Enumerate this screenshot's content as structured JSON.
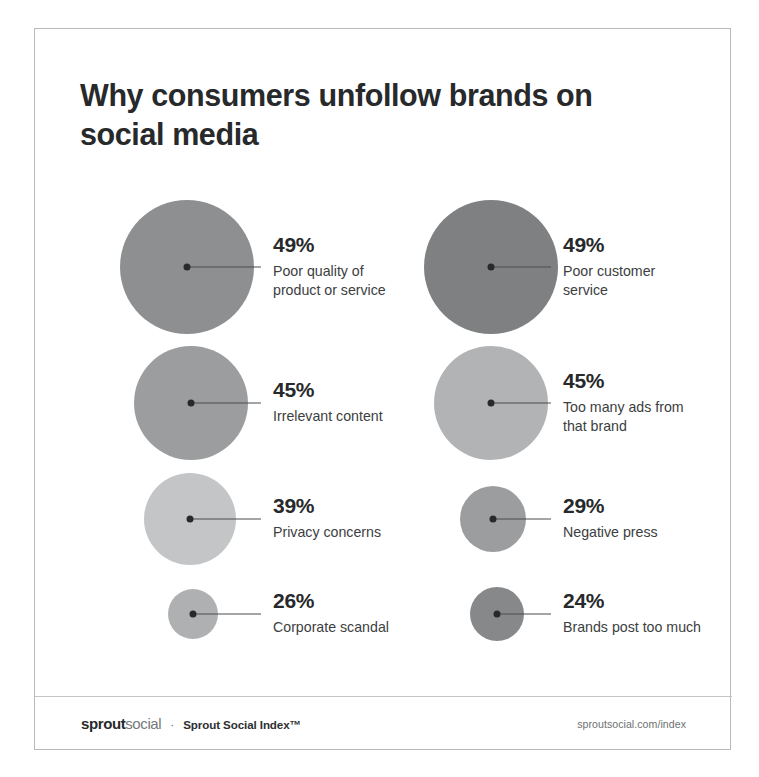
{
  "title": "Why consumers unfollow brands on social media",
  "chart_data": {
    "type": "bubble",
    "title": "Why consumers unfollow brands on social media",
    "xlabel": "",
    "ylabel": "",
    "units": "percent of consumers",
    "legend": "none",
    "grid": false,
    "categories": [
      "Poor quality of product or service",
      "Poor customer service",
      "Irrelevant content",
      "Too many ads from that brand",
      "Privacy concerns",
      "Negative press",
      "Corporate scandal",
      "Brands post too much"
    ],
    "values": [
      49,
      49,
      45,
      45,
      39,
      29,
      26,
      24
    ],
    "points": [
      {
        "value": 49,
        "value_label": "49%",
        "label": "Poor quality of product or service",
        "label_line1": "Poor quality of",
        "label_line2": "product or service",
        "color": "#8d8f91",
        "cx": 152,
        "cy": 238,
        "diameter": 134,
        "label_x": 238
      },
      {
        "value": 49,
        "value_label": "49%",
        "label": "Poor customer service",
        "label_line1": "Poor customer",
        "label_line2": "service",
        "color": "#7e8082",
        "cx": 456,
        "cy": 238,
        "diameter": 134,
        "label_x": 528
      },
      {
        "value": 45,
        "value_label": "45%",
        "label": "Irrelevant content",
        "label_line1": "Irrelevant content",
        "label_line2": "",
        "color": "#9b9d9f",
        "cx": 156,
        "cy": 374,
        "diameter": 114,
        "label_x": 238
      },
      {
        "value": 45,
        "value_label": "45%",
        "label": "Too many ads from that brand",
        "label_line1": "Too many ads from",
        "label_line2": "that brand",
        "color": "#b1b3b5",
        "cx": 456,
        "cy": 374,
        "diameter": 114,
        "label_x": 528
      },
      {
        "value": 39,
        "value_label": "39%",
        "label": "Privacy concerns",
        "label_line1": "Privacy concerns",
        "label_line2": "",
        "color": "#c3c5c7",
        "cx": 155,
        "cy": 490,
        "diameter": 92,
        "label_x": 238
      },
      {
        "value": 29,
        "value_label": "29%",
        "label": "Negative press",
        "label_line1": "Negative press",
        "label_line2": "",
        "color": "#9b9d9f",
        "cx": 458,
        "cy": 490,
        "diameter": 66,
        "label_x": 528
      },
      {
        "value": 26,
        "value_label": "26%",
        "label": "Corporate scandal",
        "label_line1": "Corporate scandal",
        "label_line2": "",
        "color": "#aeb0b2",
        "cx": 158,
        "cy": 585,
        "diameter": 50,
        "label_x": 238
      },
      {
        "value": 24,
        "value_label": "24%",
        "label": "Brands post too much",
        "label_line1": "Brands post too much",
        "label_line2": "",
        "color": "#86888a",
        "cx": 462,
        "cy": 585,
        "diameter": 54,
        "label_x": 528
      }
    ]
  },
  "footer": {
    "logo_bold": "sprout",
    "logo_light": "social",
    "separator": "·",
    "tagline": "Sprout Social Index™",
    "url": "sproutsocial.com/index"
  },
  "colors": {
    "text_primary": "#27292b",
    "text_secondary": "#3c3e40",
    "frame_border": "#b9b9b9",
    "leader_line": "#4a4c4e",
    "background": "#ffffff"
  }
}
